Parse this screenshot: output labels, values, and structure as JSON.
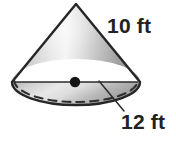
{
  "figure": {
    "name": "cone-diagram",
    "shape": "cone",
    "background_color": "#ffffff",
    "outline_color": "#222222",
    "fill_light": "#f2f2f2",
    "fill_mid": "#c9c9c9",
    "fill_dark": "#8f8f8f",
    "center_dot_color": "#1a1a1a"
  },
  "labels": {
    "slant_height": "10 ft",
    "diameter": "12 ft"
  },
  "annotations": {
    "center_point": "center-dot",
    "hidden_edge": "dashed-back-arc",
    "diameter_line": "solid-diameter-line",
    "leader_line": "diameter-leader-line"
  },
  "measurements": {
    "slant_height_value": "10",
    "slant_height_unit": "ft",
    "diameter_value": "12",
    "diameter_unit": "ft"
  }
}
